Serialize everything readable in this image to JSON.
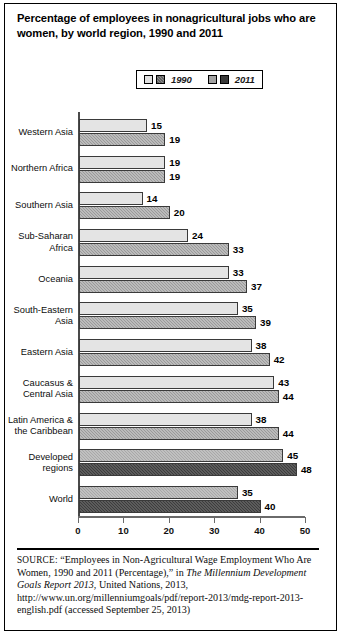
{
  "figure": {
    "title": "Percentage of employees in nonagricultural jobs who are women, by world region, 1990 and 2011"
  },
  "legend": {
    "entries": [
      {
        "label": "1990",
        "swatch_a": "#e2e2e2",
        "swatch_b": "#8f8f8f"
      },
      {
        "label": "2011",
        "swatch_a": "#a3a3a3",
        "swatch_b": "#3a3a3a"
      }
    ]
  },
  "source_note": {
    "prefix": "SOURCE:",
    "part1": " “Employees in Non-Agricultural Wage Employment Who Are Women, 1990 and 2011 (Percentage),” in ",
    "italic1": "The Millennium Development Goals Report 2013",
    "part2": ", United Nations, 2013, http://www.un.org/millenniumgoals/pdf/report-2013/mdg-report-2013-english.pdf (accessed September 25, 2013)"
  },
  "chart_data": {
    "type": "bar",
    "orientation": "horizontal",
    "title": "Percentage of employees in nonagricultural jobs who are women, by world region, 1990 and 2011",
    "xlabel": "",
    "ylabel": "",
    "xlim": [
      0,
      50
    ],
    "xticks": [
      0,
      10,
      20,
      30,
      40,
      50
    ],
    "grid": false,
    "legend_position": "top-center",
    "categories": [
      "Western Asia",
      "Northern Africa",
      "Southern Asia",
      "Sub-Saharan Africa",
      "Oceania",
      "South-Eastern Asia",
      "Eastern Asia",
      "Caucasus & Central Asia",
      "Latin America & the Caribbean",
      "Developed regions",
      "World"
    ],
    "series": [
      {
        "name": "1990",
        "values": [
          15,
          19,
          14,
          24,
          33,
          35,
          38,
          43,
          38,
          45,
          35
        ]
      },
      {
        "name": "2011",
        "values": [
          19,
          19,
          20,
          33,
          37,
          39,
          42,
          44,
          44,
          48,
          40
        ]
      }
    ],
    "rows": [
      {
        "label": "Western Asia",
        "label_lines": "Western Asia",
        "v1990": 15,
        "v2011": 19,
        "style": "light"
      },
      {
        "label": "Northern Africa",
        "label_lines": "Northern Africa",
        "v1990": 19,
        "v2011": 19,
        "style": "light"
      },
      {
        "label": "Southern Asia",
        "label_lines": "Southern Asia",
        "v1990": 14,
        "v2011": 20,
        "style": "light"
      },
      {
        "label": "Sub-Saharan Africa",
        "label_lines": "Sub-Saharan\nAfrica",
        "v1990": 24,
        "v2011": 33,
        "style": "light"
      },
      {
        "label": "Oceania",
        "label_lines": "Oceania",
        "v1990": 33,
        "v2011": 37,
        "style": "light"
      },
      {
        "label": "South-Eastern Asia",
        "label_lines": "South-Eastern\nAsia",
        "v1990": 35,
        "v2011": 39,
        "style": "light"
      },
      {
        "label": "Eastern Asia",
        "label_lines": "Eastern Asia",
        "v1990": 38,
        "v2011": 42,
        "style": "light"
      },
      {
        "label": "Caucasus & Central Asia",
        "label_lines": "Caucasus &\nCentral Asia",
        "v1990": 43,
        "v2011": 44,
        "style": "light"
      },
      {
        "label": "Latin America & the Caribbean",
        "label_lines": "Latin America &\nthe Caribbean",
        "v1990": 38,
        "v2011": 44,
        "style": "light"
      },
      {
        "label": "Developed regions",
        "label_lines": "Developed\nregions",
        "v1990": 45,
        "v2011": 48,
        "style": "dark"
      },
      {
        "label": "World",
        "label_lines": "World",
        "v1990": 35,
        "v2011": 40,
        "style": "dark"
      }
    ]
  }
}
